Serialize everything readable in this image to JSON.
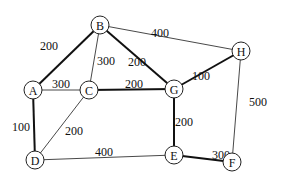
{
  "nodes": [
    {
      "id": "A",
      "x": 33,
      "y": 90
    },
    {
      "id": "B",
      "x": 100,
      "y": 25
    },
    {
      "id": "C",
      "x": 89,
      "y": 90
    },
    {
      "id": "D",
      "x": 35,
      "y": 160
    },
    {
      "id": "E",
      "x": 174,
      "y": 155
    },
    {
      "id": "F",
      "x": 232,
      "y": 162
    },
    {
      "id": "G",
      "x": 174,
      "y": 89
    },
    {
      "id": "H",
      "x": 241,
      "y": 51
    }
  ],
  "edges": [
    {
      "from": "A",
      "to": "B",
      "weight": "200",
      "thick": true,
      "lx": 40,
      "ly": 50
    },
    {
      "from": "B",
      "to": "C",
      "weight": "300",
      "thick": false,
      "lx": 97,
      "ly": 65
    },
    {
      "from": "B",
      "to": "G",
      "weight": "200",
      "thick": true,
      "lx": 128,
      "ly": 66
    },
    {
      "from": "B",
      "to": "H",
      "weight": "400",
      "thick": false,
      "lx": 151,
      "ly": 37
    },
    {
      "from": "G",
      "to": "H",
      "weight": "100",
      "thick": true,
      "lx": 192,
      "ly": 80
    },
    {
      "from": "A",
      "to": "C",
      "weight": "300",
      "thick": false,
      "lx": 52,
      "ly": 88
    },
    {
      "from": "C",
      "to": "G",
      "weight": "200",
      "thick": true,
      "lx": 125,
      "ly": 88
    },
    {
      "from": "A",
      "to": "D",
      "weight": "100",
      "thick": true,
      "lx": 12,
      "ly": 131
    },
    {
      "from": "C",
      "to": "D",
      "weight": "200",
      "thick": false,
      "lx": 65,
      "ly": 135
    },
    {
      "from": "D",
      "to": "E",
      "weight": "400",
      "thick": false,
      "lx": 95,
      "ly": 156
    },
    {
      "from": "G",
      "to": "E",
      "weight": "200",
      "thick": true,
      "lx": 175,
      "ly": 126
    },
    {
      "from": "E",
      "to": "F",
      "weight": "300",
      "thick": true,
      "lx": 212,
      "ly": 159
    },
    {
      "from": "H",
      "to": "F",
      "weight": "500",
      "thick": false,
      "lx": 249,
      "ly": 106
    }
  ]
}
